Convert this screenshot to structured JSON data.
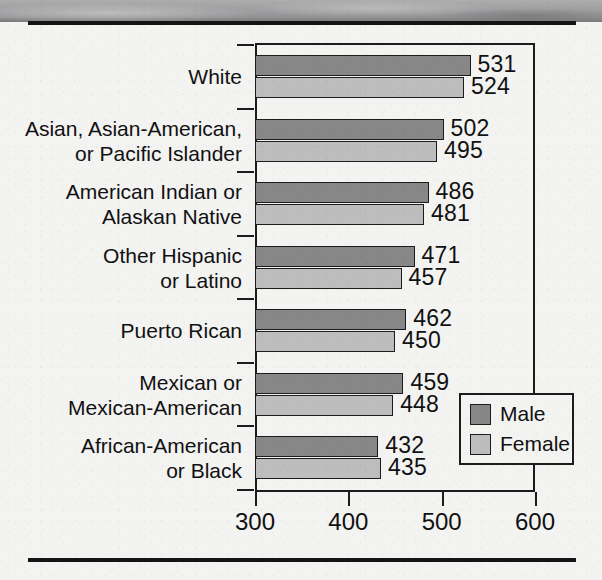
{
  "chart_data": {
    "type": "bar",
    "orientation": "horizontal",
    "title": "",
    "subtitle": "",
    "xlabel": "",
    "ylabel": "",
    "xlim": [
      300,
      600
    ],
    "xticks": [
      300,
      400,
      500,
      600
    ],
    "xticklabels": [
      "300",
      "400",
      "500",
      "600"
    ],
    "grid": false,
    "legend_position": "bottom-right",
    "legend": [
      "Male",
      "Female"
    ],
    "categories": [
      "White",
      "Asian, Asian-American,\nor Pacific Islander",
      "American Indian or\nAlaskan Native",
      "Other Hispanic\nor Latino",
      "Puerto Rican",
      "Mexican or\nMexican-American",
      "African-American\nor Black"
    ],
    "series": [
      {
        "name": "Male",
        "color": "#878787",
        "values": [
          531,
          502,
          486,
          471,
          462,
          459,
          432
        ]
      },
      {
        "name": "Female",
        "color": "#bdbdbd",
        "values": [
          524,
          495,
          481,
          457,
          450,
          448,
          435
        ]
      }
    ],
    "bar_labels": {
      "male": [
        "531",
        "502",
        "486",
        "471",
        "462",
        "459",
        "432"
      ],
      "female": [
        "524",
        "495",
        "481",
        "457",
        "450",
        "448",
        "435"
      ]
    }
  },
  "colors": {
    "male_fill": "#878787",
    "female_fill": "#bdbdbd",
    "axis": "#1c1c1c",
    "text": "#111111",
    "page_background": "#f3f3f1"
  }
}
